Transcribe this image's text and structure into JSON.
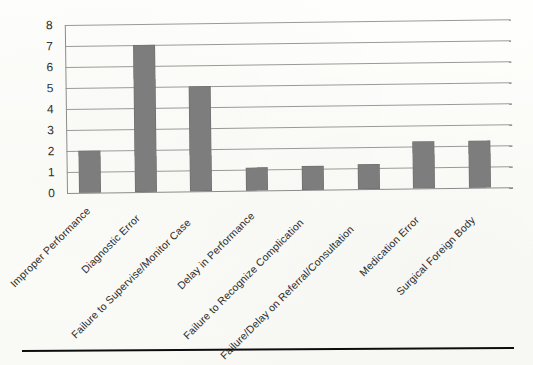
{
  "chart_data": {
    "type": "bar",
    "title": "",
    "subtitle": "",
    "xlabel": "",
    "ylabel": "",
    "ylim": [
      0,
      8
    ],
    "y_ticks": [
      0,
      1,
      2,
      3,
      4,
      5,
      6,
      7,
      8
    ],
    "grid": true,
    "legend": false,
    "legend_position": "none",
    "orientation": "vertical",
    "bar_color": "#7d7d7d",
    "gridline_color": "#9a9a9a",
    "axis_color": "#8c8c8c",
    "categories": [
      "Improper Performance",
      "Diagnostic Error",
      "Failure to Supervise/Monitor Case",
      "Delay in Performance",
      "Failure to Recognize Complication",
      "Failure/Delay on Referral/Consultation",
      "Medication Error",
      "Surgical Foreign Body"
    ],
    "values": [
      2,
      7,
      5,
      1.1,
      1.15,
      1.2,
      2.25,
      2.25
    ],
    "annotations": []
  },
  "figure": {
    "bottom_rule_visible": true
  }
}
